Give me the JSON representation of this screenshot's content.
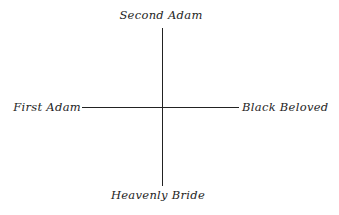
{
  "diagram": {
    "type": "cross-axis",
    "labels": {
      "top": "Second Adam",
      "bottom": "Heavenly Bride",
      "left": "First Adam",
      "right": "Black Beloved"
    },
    "colors": {
      "text": "#1e1e1e",
      "line": "#222222",
      "background": "#ffffff"
    }
  }
}
